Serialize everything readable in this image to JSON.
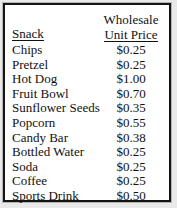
{
  "table": {
    "headers": {
      "snack": "Snack",
      "price_line1": "Wholesale",
      "price_line2": "Unit Price"
    },
    "rows": [
      {
        "snack": "Chips",
        "price": "$0.25"
      },
      {
        "snack": "Pretzel",
        "price": "$0.25"
      },
      {
        "snack": "Hot Dog",
        "price": "$1.00"
      },
      {
        "snack": "Fruit Bowl",
        "price": "$0.70"
      },
      {
        "snack": "Sunflower Seeds",
        "price": "$0.35"
      },
      {
        "snack": "Popcorn",
        "price": "$0.55"
      },
      {
        "snack": "Candy Bar",
        "price": "$0.38"
      },
      {
        "snack": "Bottled Water",
        "price": "$0.25"
      },
      {
        "snack": "Soda",
        "price": "$0.25"
      },
      {
        "snack": "Coffee",
        "price": "$0.25"
      },
      {
        "snack": "Sports Drink",
        "price": "$0.50"
      }
    ]
  }
}
